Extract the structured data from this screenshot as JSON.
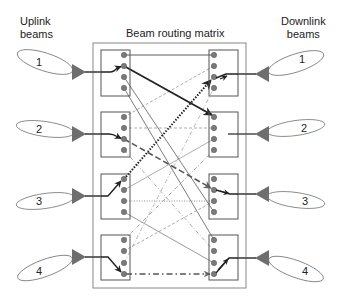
{
  "labels": {
    "uplink": "Uplink\nbeams",
    "downlink": "Downlink\nbeams",
    "title": "Beam routing matrix"
  },
  "uplink_beams": [
    "1",
    "2",
    "3",
    "4"
  ],
  "downlink_beams": [
    "1",
    "2",
    "3",
    "4"
  ],
  "colors": {
    "line": "#333333",
    "dashed": "#888888",
    "port": "#7a7a7a",
    "triangle": "#6e6e6e",
    "box": "#555555",
    "outer_box": "#888888"
  },
  "routing": [
    {
      "from": "U1 port 2",
      "to": "D2 port 1",
      "style": "thick solid arrow"
    },
    {
      "from": "U3 port 1",
      "to": "D1 port 3",
      "style": "thick dotted arrow"
    },
    {
      "from": "U2 port 3",
      "to": "D3 port 2",
      "style": "thick dashed arrow"
    },
    {
      "from": "U4 port 4",
      "to": "D4 port 4",
      "style": "dash-dot arrow"
    },
    {
      "from": "U1 port 1",
      "to": "D1 port 1",
      "style": "thin solid"
    },
    {
      "from": "U1 port 3",
      "to": "D3 port 4",
      "style": "thin solid"
    },
    {
      "from": "U1 port 4",
      "to": "D4 port 1",
      "style": "thin solid"
    },
    {
      "from": "U2 port 1",
      "to": "D1 port 2",
      "style": "thin dashed"
    },
    {
      "from": "U2 port 2",
      "to": "D2 port 2",
      "style": "thin dashed"
    },
    {
      "from": "U3 port 2",
      "to": "D2 port 3",
      "style": "thin solid"
    },
    {
      "from": "U3 port 3",
      "to": "D3 port 3",
      "style": "thin dotted"
    },
    {
      "from": "U3 port 4",
      "to": "D4 port 3",
      "style": "thin solid"
    },
    {
      "from": "U4 port 1",
      "to": "D2 port 4",
      "style": "thin dash-dot"
    },
    {
      "from": "U4 port 2",
      "to": "D3 port 1",
      "style": "thin dashed"
    },
    {
      "from": "U4 port 3",
      "to": "D1 port 4",
      "style": "thin dash-dot"
    },
    {
      "from": "U2 port 4",
      "to": "D4 port 2",
      "style": "thin dash-dot"
    }
  ]
}
